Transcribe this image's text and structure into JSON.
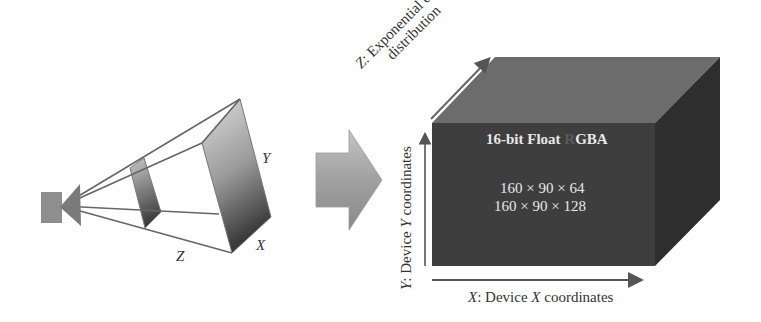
{
  "diagram": {
    "frustum": {
      "axis_labels": {
        "y": "Y",
        "x": "X",
        "z": "Z"
      }
    },
    "transition_arrow": {
      "icon": "right-arrow-icon"
    },
    "volume": {
      "title_prefix": "16-bit Float ",
      "title_faded": "R",
      "title_suffix": "GBA",
      "dimensions": [
        "160 × 90 × 64",
        "160 × 90 × 128"
      ],
      "axes": {
        "z_line1": "Z: Exponential depth",
        "z_line2": "distribution",
        "z_prefix": "Z",
        "z_rest_line1": ": Exponential depth",
        "y_prefix": "Y",
        "y_mid": ": Device ",
        "y_var": "Y",
        "y_rest": " coordinates",
        "x_prefix": "X",
        "x_mid": ": Device ",
        "x_var": "X",
        "x_rest": " coordinates"
      }
    },
    "colors": {
      "cube_front": "#3e3e3e",
      "cube_top": "#6c6c6c",
      "cube_side": "#2e2e2e",
      "outline": "#555555"
    }
  }
}
